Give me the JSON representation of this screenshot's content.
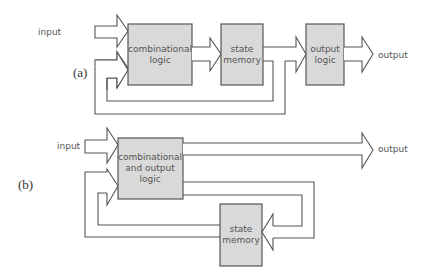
{
  "diagram_a": {
    "tag": "(a)",
    "input_label": "input",
    "output_label": "output",
    "blocks": {
      "combinational_logic": [
        "combinational",
        "logic"
      ],
      "state_memory": [
        "state",
        "memory"
      ],
      "output_logic": [
        "output",
        "logic"
      ]
    }
  },
  "diagram_b": {
    "tag": "(b)",
    "input_label": "input",
    "output_label": "output",
    "blocks": {
      "combinational_output_logic": [
        "combinational",
        "and output",
        "logic"
      ],
      "state_memory": [
        "state",
        "memory"
      ]
    }
  },
  "colors": {
    "block_fill": "#d9d9d9",
    "stroke": "#555555",
    "background": "#ffffff"
  }
}
